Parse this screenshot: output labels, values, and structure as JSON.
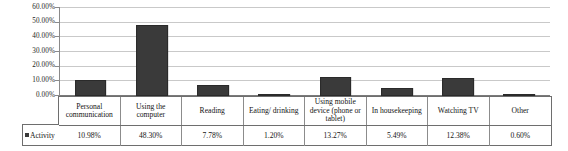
{
  "chart_data": {
    "type": "bar",
    "title": "",
    "xlabel": "",
    "ylabel": "",
    "ylim": [
      0,
      60
    ],
    "ytick_labels": [
      "60.00%",
      "50.00%",
      "40.00%",
      "30.00%",
      "20.00%",
      "10.00%",
      "0.00%"
    ],
    "ytick_values": [
      60,
      50,
      40,
      30,
      20,
      10,
      0
    ],
    "grid": true,
    "legend_position": "table-row-left",
    "series_name": "Activity",
    "bar_color": "#3a3a3a",
    "categories": [
      "Personal communication",
      "Using the computer",
      "Reading",
      "Eating/ drinking",
      "Using mobile device (phone or tablet)",
      "In housekeeping",
      "Watching TV",
      "Other"
    ],
    "values": [
      10.98,
      48.3,
      7.78,
      1.2,
      13.27,
      5.49,
      12.38,
      0.6
    ],
    "value_labels": [
      "10.98%",
      "48.30%",
      "7.78%",
      "1.20%",
      "13.27%",
      "5.49%",
      "12.38%",
      "0.60%"
    ]
  },
  "table": {
    "legend_label": "Activity",
    "legend_marker": "filled-square"
  }
}
